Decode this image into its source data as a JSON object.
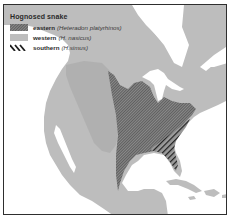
{
  "map": {
    "title": "Hognosed snake",
    "colors": {
      "land": "#bdbdbd",
      "water": "#ffffff",
      "western_range": "#acacac",
      "eastern_hatch": "#4a4a4a",
      "southern_stripe": "#262626",
      "frame": "#2e2e2e"
    },
    "legend": [
      {
        "id": "eastern",
        "name": "eastern",
        "scientific": "(Heteradon platyrhinos)",
        "pattern": "fine-diagonal-hatch"
      },
      {
        "id": "western",
        "name": "western",
        "scientific": "(H. nasicus)",
        "pattern": "solid-gray"
      },
      {
        "id": "southern",
        "name": "southern",
        "scientific": "(H.simus)",
        "pattern": "bold-diagonal-stripes"
      }
    ]
  }
}
